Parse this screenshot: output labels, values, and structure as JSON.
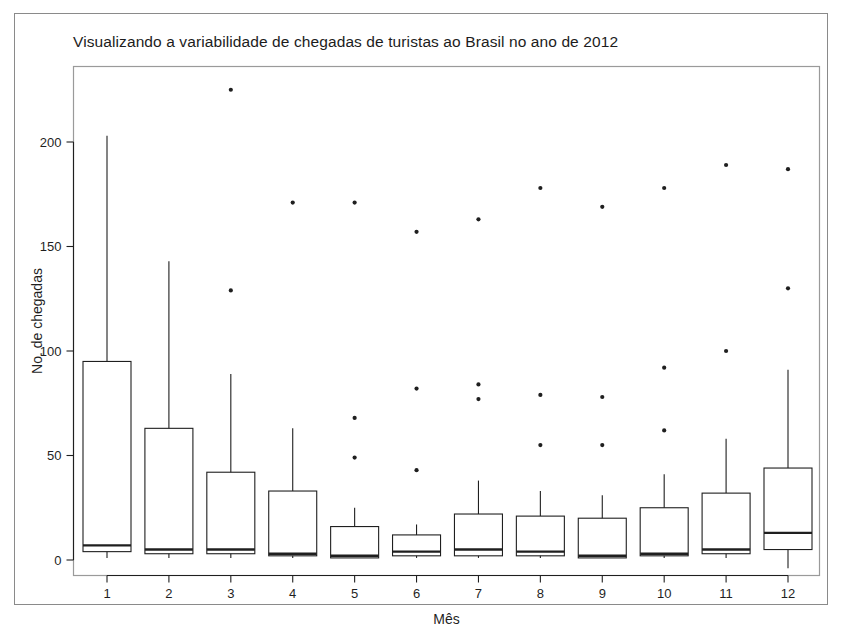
{
  "figure": {
    "title": "Visualizando a variabilidade de chegadas de turistas ao Brasil no ano de 2012",
    "background_color": "#ffffff",
    "frame_color": "#8a8a8a",
    "ink_color": "#1f1f1f"
  },
  "chart_data": {
    "type": "box",
    "title": "Visualizando a variabilidade de chegadas de turistas ao Brasil no ano de 2012",
    "xlabel": "Mês",
    "ylabel": "No. de chegadas",
    "categories": [
      "1",
      "2",
      "3",
      "4",
      "5",
      "6",
      "7",
      "8",
      "9",
      "10",
      "11",
      "12"
    ],
    "xtick_labels": [
      "1",
      "2",
      "3",
      "4",
      "5",
      "6",
      "7",
      "8",
      "9",
      "10",
      "11",
      "12"
    ],
    "ytick_labels": [
      "0",
      "50",
      "100",
      "150",
      "200"
    ],
    "yticks": [
      0,
      50,
      100,
      150,
      200
    ],
    "ylim": [
      -8,
      236
    ],
    "grid": false,
    "legend": false,
    "boxes": [
      {
        "category": "1",
        "whisker_low": 1,
        "q1": 4,
        "median": 7,
        "q3": 95,
        "whisker_high": 203,
        "outliers": []
      },
      {
        "category": "2",
        "whisker_low": 1,
        "q1": 3,
        "median": 5,
        "q3": 63,
        "whisker_high": 143,
        "outliers": []
      },
      {
        "category": "3",
        "whisker_low": 1,
        "q1": 3,
        "median": 5,
        "q3": 42,
        "whisker_high": 89,
        "outliers": [
          225,
          129
        ]
      },
      {
        "category": "4",
        "whisker_low": 1,
        "q1": 2,
        "median": 3,
        "q3": 33,
        "whisker_high": 63,
        "outliers": [
          171
        ]
      },
      {
        "category": "5",
        "whisker_low": 1,
        "q1": 1,
        "median": 2,
        "q3": 16,
        "whisker_high": 25,
        "outliers": [
          171,
          68,
          49
        ]
      },
      {
        "category": "6",
        "whisker_low": 1,
        "q1": 2,
        "median": 4,
        "q3": 12,
        "whisker_high": 17,
        "outliers": [
          157,
          82,
          43
        ]
      },
      {
        "category": "7",
        "whisker_low": 1,
        "q1": 2,
        "median": 5,
        "q3": 22,
        "whisker_high": 38,
        "outliers": [
          163,
          84,
          77
        ]
      },
      {
        "category": "8",
        "whisker_low": 1,
        "q1": 2,
        "median": 4,
        "q3": 21,
        "whisker_high": 33,
        "outliers": [
          178,
          79,
          55
        ]
      },
      {
        "category": "9",
        "whisker_low": 1,
        "q1": 1,
        "median": 2,
        "q3": 20,
        "whisker_high": 31,
        "outliers": [
          169,
          78,
          55
        ]
      },
      {
        "category": "10",
        "whisker_low": 1,
        "q1": 2,
        "median": 3,
        "q3": 25,
        "whisker_high": 41,
        "outliers": [
          178,
          92,
          62
        ]
      },
      {
        "category": "11",
        "whisker_low": 1,
        "q1": 3,
        "median": 5,
        "q3": 32,
        "whisker_high": 58,
        "outliers": [
          189,
          100
        ]
      },
      {
        "category": "12",
        "whisker_low": -4,
        "q1": 5,
        "median": 13,
        "q3": 44,
        "whisker_high": 91,
        "outliers": [
          187,
          130
        ]
      }
    ]
  }
}
